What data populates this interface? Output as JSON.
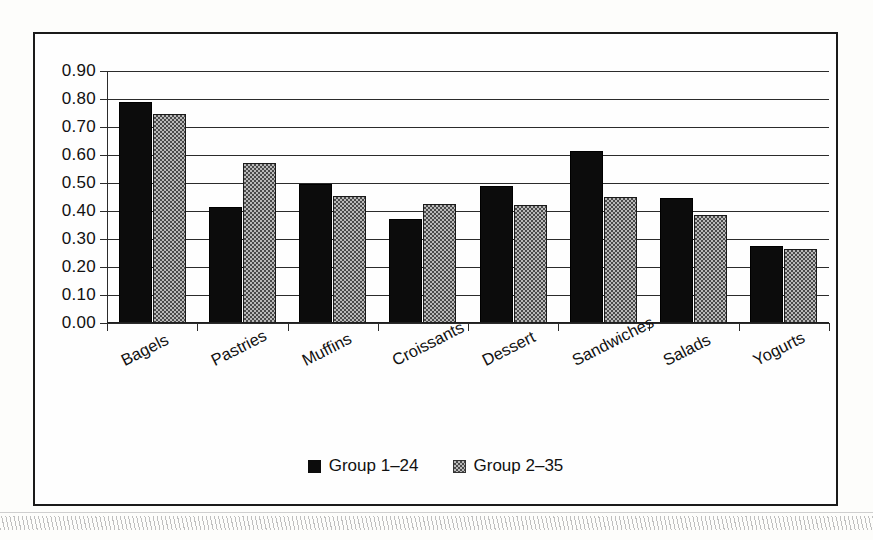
{
  "chart_data": {
    "type": "bar",
    "title": "",
    "xlabel": "",
    "ylabel": "",
    "ylim": [
      0.0,
      0.9
    ],
    "ytick_step": 0.1,
    "grid": true,
    "legend_position": "bottom",
    "categories": [
      "Bagels",
      "Pastries",
      "Muffins",
      "Croissants",
      "Dessert",
      "Sandwiches",
      "Salads",
      "Yogurts"
    ],
    "ytick_labels": [
      "0.90",
      "0.80",
      "0.70",
      "0.60",
      "0.50",
      "0.40",
      "0.30",
      "0.20",
      "0.10",
      "0.00"
    ],
    "ytick_values": [
      0.9,
      0.8,
      0.7,
      0.6,
      0.5,
      0.4,
      0.3,
      0.2,
      0.1,
      0.0
    ],
    "series": [
      {
        "name": "Group 1–24",
        "fill": "solid-black",
        "color": "#0c0c0c",
        "values": [
          0.79,
          0.415,
          0.495,
          0.37,
          0.49,
          0.615,
          0.445,
          0.275
        ]
      },
      {
        "name": "Group 2–35",
        "fill": "checkered-gray",
        "color": "#b9b9b9",
        "values": [
          0.745,
          0.57,
          0.455,
          0.425,
          0.42,
          0.45,
          0.385,
          0.265
        ]
      }
    ]
  },
  "legend": {
    "items": [
      {
        "label": "Group 1–24"
      },
      {
        "label": "Group 2–35"
      }
    ]
  },
  "frame": {
    "border_color": "#1a1a1a",
    "background": "#fefefe"
  }
}
